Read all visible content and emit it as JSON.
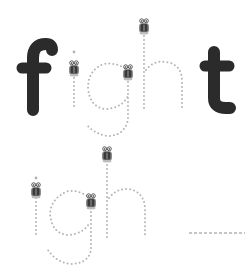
{
  "worksheet": {
    "word": "fight",
    "traced_part": "igh",
    "row1": {
      "solid_letters": [
        "f",
        "t"
      ],
      "dotted_letters": [
        "i",
        "g",
        "h"
      ]
    },
    "row2": {
      "dotted_letters": [
        "i",
        "g",
        "h"
      ],
      "blank_line": "__________"
    },
    "icons": [
      "bug-car-start-icon"
    ],
    "colors": {
      "solid_letter": "#2b2b2b",
      "dots": "#b4b4b4",
      "icon_body": "#3a3a3a",
      "icon_face": "#9a9a9a",
      "background": "#ffffff"
    }
  }
}
